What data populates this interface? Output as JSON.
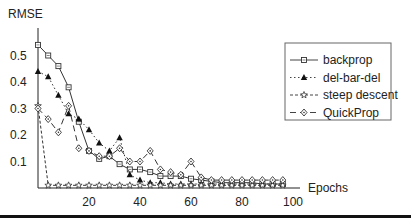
{
  "chart_data": {
    "type": "line",
    "title": "",
    "xlabel": "Epochs",
    "ylabel": "RMSE",
    "xlim": [
      0,
      100
    ],
    "ylim": [
      0,
      0.55
    ],
    "x_ticks": [
      "20",
      "40",
      "60",
      "80",
      "100"
    ],
    "y_ticks": [
      "0.1",
      "0.2",
      "0.3",
      "0.4",
      "0.5"
    ],
    "grid": false,
    "legend_position": "upper right",
    "x": [
      0,
      4,
      8,
      12,
      16,
      20,
      24,
      28,
      32,
      36,
      40,
      44,
      48,
      52,
      56,
      60,
      64,
      68,
      72,
      76,
      80,
      84,
      88,
      92,
      96
    ],
    "series": [
      {
        "name": "backprop",
        "style": "solid",
        "marker": "square",
        "values": [
          0.54,
          0.5,
          0.46,
          0.38,
          0.25,
          0.14,
          0.11,
          0.12,
          0.09,
          0.07,
          0.07,
          0.06,
          0.045,
          0.045,
          0.045,
          0.035,
          0.03,
          0.025,
          0.02,
          0.02,
          0.02,
          0.02,
          0.015,
          0.015,
          0.015
        ]
      },
      {
        "name": "del-bar-del",
        "style": "dotted",
        "marker": "filled-triangle",
        "values": [
          0.44,
          0.42,
          0.35,
          0.28,
          0.26,
          0.22,
          0.17,
          0.14,
          0.19,
          0.05,
          0.03,
          0.02,
          0.02,
          0.015,
          0.015,
          0.015,
          0.015,
          0.015,
          0.015,
          0.015,
          0.015,
          0.015,
          0.015,
          0.015,
          0.015
        ]
      },
      {
        "name": "steep descent",
        "style": "dashed",
        "marker": "star",
        "values": [
          0.31,
          0.01,
          0.01,
          0.01,
          0.01,
          0.01,
          0.01,
          0.01,
          0.01,
          0.01,
          0.01,
          0.01,
          0.01,
          0.01,
          0.01,
          0.01,
          0.01,
          0.01,
          0.01,
          0.01,
          0.01,
          0.01,
          0.01,
          0.01,
          0.01
        ]
      },
      {
        "name": "QuickProp",
        "style": "dash",
        "marker": "diamond",
        "values": [
          0.3,
          0.26,
          0.21,
          0.31,
          0.15,
          0.14,
          0.12,
          0.12,
          0.15,
          0.1,
          0.1,
          0.14,
          0.07,
          0.06,
          0.05,
          0.1,
          0.04,
          0.03,
          0.03,
          0.03,
          0.03,
          0.03,
          0.03,
          0.03,
          0.03
        ]
      }
    ]
  },
  "axes": {
    "y_title": "RMSE",
    "x_title": "Epochs"
  },
  "legend": {
    "items": [
      "backprop",
      "del-bar-del",
      "steep descent",
      "QuickProp"
    ]
  }
}
